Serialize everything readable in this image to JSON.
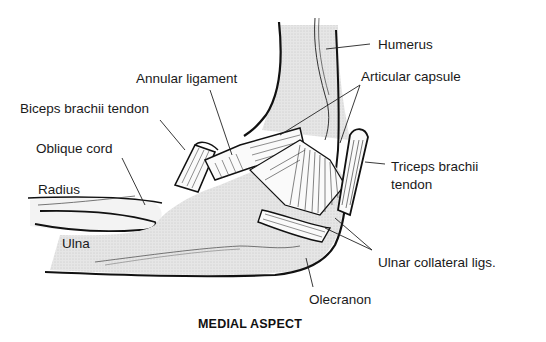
{
  "diagram": {
    "title": "MEDIAL ASPECT",
    "labels": [
      {
        "id": "humerus",
        "text": "Humerus",
        "x": 378,
        "y": 38
      },
      {
        "id": "articular-capsule",
        "text": "Articular capsule",
        "x": 361,
        "y": 70
      },
      {
        "id": "annular-ligament",
        "text": "Annular ligament",
        "x": 136,
        "y": 72
      },
      {
        "id": "biceps-brachii-tendon",
        "text": "Biceps brachii tendon",
        "x": 20,
        "y": 102
      },
      {
        "id": "oblique-cord",
        "text": "Oblique cord",
        "x": 36,
        "y": 142
      },
      {
        "id": "radius",
        "text": "Radius",
        "x": 38,
        "y": 183
      },
      {
        "id": "ulna",
        "text": "Ulna",
        "x": 62,
        "y": 237
      },
      {
        "id": "triceps-brachii-tendon-1",
        "text": "Triceps brachii",
        "x": 391,
        "y": 162
      },
      {
        "id": "triceps-brachii-tendon-2",
        "text": "tendon",
        "x": 391,
        "y": 180
      },
      {
        "id": "ulnar-collateral-ligs",
        "text": "Ulnar collateral ligs.",
        "x": 378,
        "y": 255
      },
      {
        "id": "olecranon",
        "text": "Olecranon",
        "x": 309,
        "y": 293
      }
    ]
  }
}
